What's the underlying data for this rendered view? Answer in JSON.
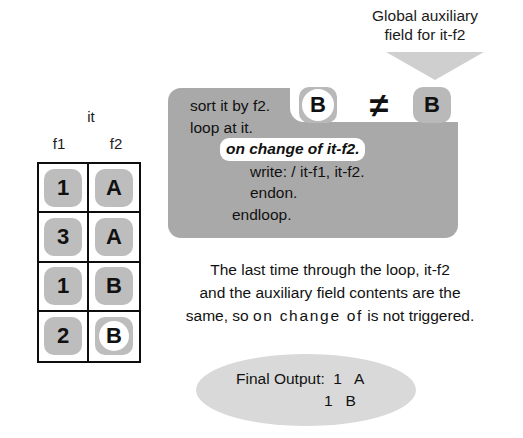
{
  "caption": {
    "line1": "Global auxiliary",
    "line2": "field for it-f2"
  },
  "arrow": {
    "icon": "down-triangle-arrow-icon",
    "color": "#cfcfcf"
  },
  "code_block": {
    "background_color": "#a9a9a9",
    "lines": [
      {
        "text": "sort it by f2.",
        "indent": 0,
        "highlight": false,
        "italic": false
      },
      {
        "text": "loop at it.",
        "indent": 0,
        "highlight": false,
        "italic": false
      },
      {
        "text": "on change of it-f2.",
        "indent": 1,
        "highlight": true,
        "italic": true
      },
      {
        "text": "write: / it-f1, it-f2.",
        "indent": 2,
        "highlight": false,
        "italic": false
      },
      {
        "text": "endon.",
        "indent": 2,
        "highlight": false,
        "italic": false
      },
      {
        "text": "endloop.",
        "indent": 3,
        "highlight": false,
        "italic": false
      }
    ]
  },
  "comparison": {
    "aux_value": "B",
    "operator": "≠",
    "field_value": "B",
    "aux_chip_color": "#b9b9b9",
    "field_chip_color": "#b9b9b9"
  },
  "table": {
    "title": "it",
    "columns": [
      "f1",
      "f2"
    ],
    "rows": [
      {
        "f1": "1",
        "f2": "A",
        "f1_marked": false,
        "f2_marked": false
      },
      {
        "f1": "3",
        "f2": "A",
        "f1_marked": false,
        "f2_marked": false
      },
      {
        "f1": "1",
        "f2": "B",
        "f1_marked": false,
        "f2_marked": false
      },
      {
        "f1": "2",
        "f2": "B",
        "f1_marked": false,
        "f2_marked": true
      }
    ],
    "cell_color": "#bdbdbd",
    "border_color": "#0d0d0d"
  },
  "explanation": {
    "line1": "The last time through the loop, it-f2",
    "line2": "and the auxiliary field contents are the",
    "line3_a": "same, so ",
    "line3_b": "on change of",
    "line3_c": " is not triggered."
  },
  "final_output": {
    "label": "Final Output:",
    "rows": [
      {
        "f1": "1",
        "f2": "A"
      },
      {
        "f1": "1",
        "f2": "B"
      }
    ],
    "line1": "Final Output:  1   A",
    "line2": "1   B",
    "ellipse_color": "#d9d9d9"
  }
}
